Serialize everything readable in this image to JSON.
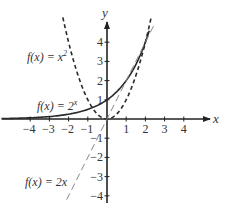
{
  "chart_data": {
    "type": "line",
    "title": "",
    "xlabel": "x",
    "ylabel": "y",
    "xlim": [
      -5.5,
      5.5
    ],
    "ylim": [
      -4.5,
      5.5
    ],
    "grid": false,
    "x_ticks": [
      -4,
      -3,
      -2,
      -1,
      1,
      2,
      3,
      4
    ],
    "y_ticks": [
      -4,
      -3,
      -2,
      -1,
      1,
      2,
      3,
      4
    ],
    "x_tick_labels": [
      "−4",
      "−3",
      "−2",
      "−1",
      "1",
      "2",
      "3",
      "4"
    ],
    "y_tick_labels": [
      "−4",
      "−3",
      "−2",
      "−1",
      "1",
      "2",
      "3",
      "4"
    ],
    "series": [
      {
        "name": "f(x) = 2^x",
        "label_text": "f(x) = 2",
        "label_sup": "x",
        "style": "solid",
        "x": [
          -5.5,
          -4,
          -3,
          -2,
          -1,
          0,
          1,
          2,
          2.2
        ],
        "values": [
          0.022,
          0.0625,
          0.125,
          0.25,
          0.5,
          1,
          2,
          4,
          4.59
        ]
      },
      {
        "name": "f(x) = x^2",
        "label_text": "f(x) = x",
        "label_sup": "2",
        "style": "dashed",
        "x": [
          -2.3,
          -2,
          -1,
          0,
          1,
          2,
          2.3
        ],
        "values": [
          5.29,
          4,
          1,
          0,
          1,
          4,
          5.29
        ]
      },
      {
        "name": "f(x) = 2x",
        "label_text": "f(x) = 2x",
        "label_sup": "",
        "style": "light-dashed",
        "x": [
          -2.1,
          -1,
          0,
          1,
          2,
          2.5
        ],
        "values": [
          -4.2,
          -2,
          0,
          2,
          4,
          5
        ]
      }
    ]
  },
  "axes": {
    "x_name": "x",
    "y_name": "y"
  }
}
